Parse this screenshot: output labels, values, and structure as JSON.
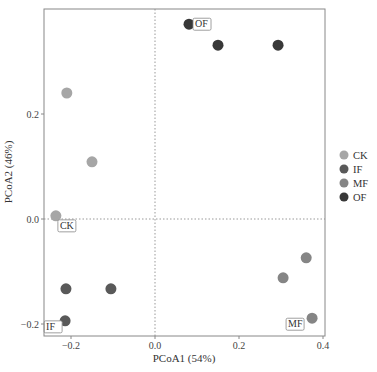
{
  "chart_data": {
    "type": "scatter",
    "title": "",
    "xlabel": "PCoA1 (54%)",
    "ylabel": "PCoA2 (46%)",
    "xlim": [
      -0.265,
      0.41
    ],
    "ylim": [
      -0.222,
      0.4
    ],
    "x_ticks": [
      -0.2,
      0.0,
      0.2,
      0.4
    ],
    "x_tick_labels": [
      "−0.2",
      "0.0",
      "0.2",
      "0.4"
    ],
    "y_ticks": [
      -0.2,
      0.0,
      0.2
    ],
    "y_tick_labels": [
      "−0.2",
      "0.0",
      "0.2"
    ],
    "grid": false,
    "reference_lines": {
      "x": 0.0,
      "y": 0.0,
      "style": "dotted"
    },
    "legend_position": "right",
    "series": [
      {
        "name": "CK",
        "color": "#a6a6a6",
        "points": [
          {
            "x": -0.21,
            "y": 0.24
          },
          {
            "x": -0.15,
            "y": 0.109
          },
          {
            "x": -0.236,
            "y": 0.006
          }
        ],
        "label": {
          "text": "CK",
          "anchor_index": 2
        }
      },
      {
        "name": "IF",
        "color": "#595959",
        "points": [
          {
            "x": -0.212,
            "y": -0.133
          },
          {
            "x": -0.105,
            "y": -0.133
          },
          {
            "x": -0.214,
            "y": -0.194
          }
        ],
        "label": {
          "text": "IF",
          "anchor_index": 2
        }
      },
      {
        "name": "MF",
        "color": "#858585",
        "points": [
          {
            "x": 0.36,
            "y": -0.074
          },
          {
            "x": 0.305,
            "y": -0.112
          },
          {
            "x": 0.374,
            "y": -0.189
          }
        ],
        "label": {
          "text": "MF",
          "anchor_index": 2
        }
      },
      {
        "name": "OF",
        "color": "#383838",
        "points": [
          {
            "x": 0.081,
            "y": 0.371
          },
          {
            "x": 0.15,
            "y": 0.331
          },
          {
            "x": 0.293,
            "y": 0.331
          }
        ],
        "label": {
          "text": "OF",
          "anchor_index": 0
        }
      }
    ]
  }
}
